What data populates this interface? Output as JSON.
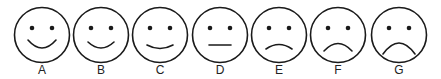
{
  "colors": {
    "stroke": "#1a1a1a",
    "background": "#ffffff"
  },
  "faces": [
    {
      "label": "A",
      "expression": "big-smile",
      "cx": 42,
      "mouth": "M28,40 Q42,56 56,40"
    },
    {
      "label": "B",
      "expression": "smile",
      "cx": 101,
      "mouth": "M88,42 Q101,54 114,42"
    },
    {
      "label": "C",
      "expression": "slight-smile",
      "cx": 160,
      "mouth": "M147,45 Q160,52 173,45"
    },
    {
      "label": "D",
      "expression": "neutral",
      "cx": 220,
      "mouth": "M209,45 L231,45"
    },
    {
      "label": "E",
      "expression": "slight-frown",
      "cx": 279,
      "mouth": "M266,49 Q279,40 292,49"
    },
    {
      "label": "F",
      "expression": "frown",
      "cx": 338,
      "mouth": "M324,51 Q338,36 352,51"
    },
    {
      "label": "G",
      "expression": "big-frown",
      "cx": 399,
      "mouth": "M383,54 Q399,32 415,54"
    }
  ]
}
